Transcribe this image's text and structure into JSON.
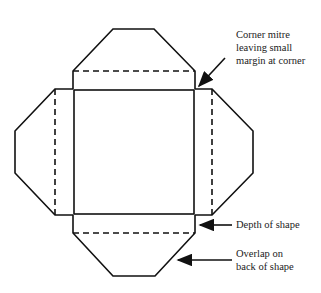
{
  "diagram": {
    "annotations": [
      {
        "id": "corner-mitre",
        "text": "Corner mitre\nleaving small\nmargin at corner"
      },
      {
        "id": "depth",
        "text": "Depth of shape"
      },
      {
        "id": "overlap",
        "text": "Overlap on\nback of shape"
      }
    ],
    "colors": {
      "line": "#111111",
      "background": "#ffffff"
    }
  }
}
